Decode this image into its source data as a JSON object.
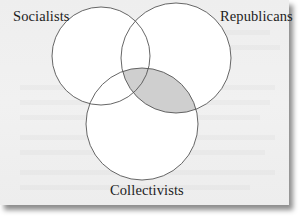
{
  "diagram": {
    "type": "venn",
    "sets": [
      {
        "id": "socialists",
        "label": "Socialists"
      },
      {
        "id": "republicans",
        "label": "Republicans"
      },
      {
        "id": "collectivists",
        "label": "Collectivists"
      }
    ],
    "highlighted_region": [
      "republicans",
      "collectivists"
    ],
    "colors": {
      "background": "#efefef",
      "circle_fill": "#ffffff",
      "circle_stroke": "#555555",
      "highlight_fill": "#cfcfcf",
      "text": "#1d1d1d"
    }
  }
}
